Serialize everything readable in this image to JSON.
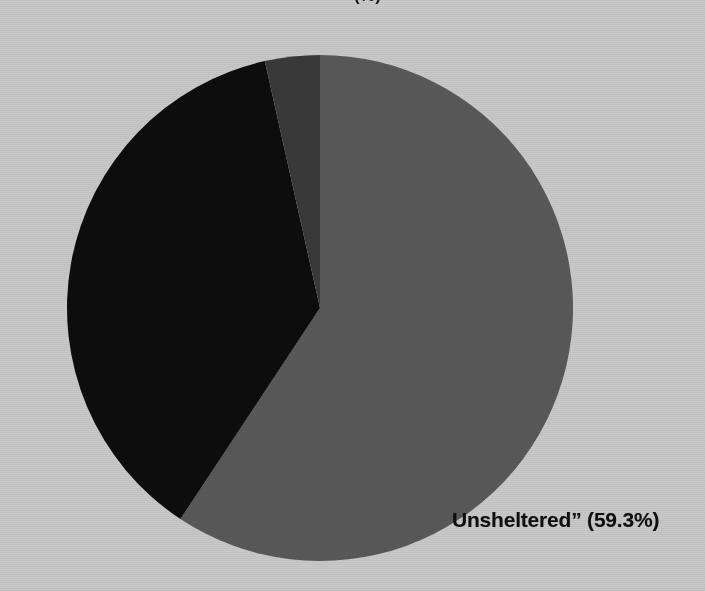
{
  "figure": {
    "background_color": "#c9c9c9",
    "cropped_title_fragment": "(%)"
  },
  "labels": {
    "unsheltered": "Unsheltered” (59.3%)"
  },
  "chart_data": {
    "type": "pie",
    "title": "",
    "xlabel": "",
    "ylabel": "",
    "legend": "none",
    "grid": false,
    "start_angle_deg": 90,
    "direction": "clockwise",
    "center": {
      "x": 320,
      "y": 308
    },
    "radius": 253,
    "categories": [
      "Unsheltered”",
      "Sheltered",
      "Other"
    ],
    "values": [
      59.3,
      37.2,
      3.5
    ],
    "value_unit": "percent",
    "colors": [
      "#595959",
      "#0d0d0d",
      "#3a3a3a"
    ],
    "annotations": [
      {
        "text": "Unsheltered” (59.3%)",
        "x": 452,
        "y": 523,
        "slice": 0
      }
    ],
    "slices": [
      {
        "name": "Unsheltered”",
        "percent": 59.3,
        "color": "#595959",
        "label_shown": true,
        "label_text": "Unsheltered” (59.3%)"
      },
      {
        "name": "Sheltered",
        "percent": 37.2,
        "color": "#0d0d0d",
        "label_shown": false,
        "label_text": ""
      },
      {
        "name": "Other",
        "percent": 3.5,
        "color": "#3a3a3a",
        "label_shown": false,
        "label_text": ""
      }
    ]
  }
}
